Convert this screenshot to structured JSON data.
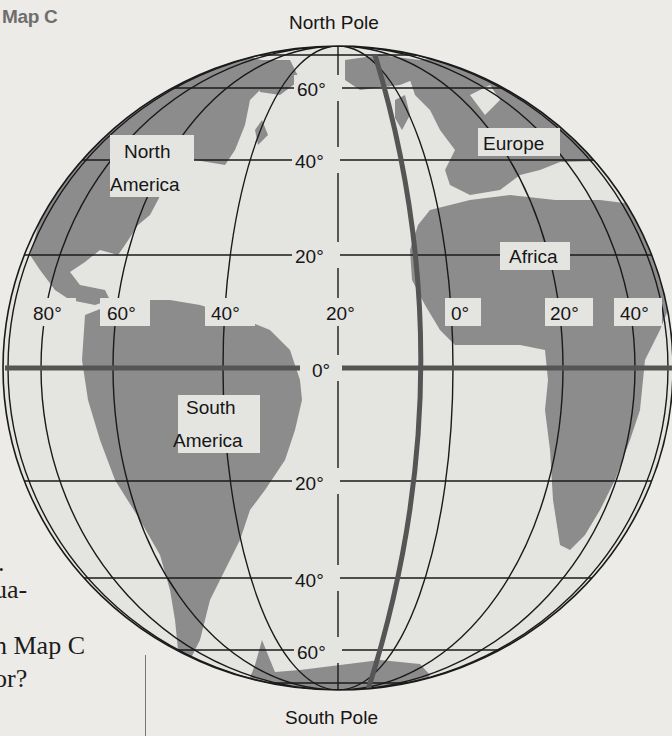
{
  "map": {
    "title": "Map C",
    "north_pole_label": "North Pole",
    "south_pole_label": "South Pole",
    "continents": [
      {
        "name": "North America",
        "lines": [
          "North",
          "America"
        ]
      },
      {
        "name": "South America",
        "lines": [
          "South",
          "America"
        ]
      },
      {
        "name": "Europe",
        "lines": [
          "Europe"
        ]
      },
      {
        "name": "Africa",
        "lines": [
          "Africa"
        ]
      }
    ],
    "latitude_labels": [
      "60°",
      "40°",
      "20°",
      "0°",
      "20°",
      "40°",
      "60°"
    ],
    "longitude_labels": [
      "80°",
      "60°",
      "40°",
      "20°",
      "0°",
      "20°",
      "40°"
    ],
    "highlighted_lines": [
      "Equator (0° latitude)",
      "Prime Meridian (0° longitude)"
    ],
    "colors": {
      "background": "#ecebe8",
      "ocean": "#e4e4e1",
      "land": "#8c8c8c",
      "grid": "#1a1a1a",
      "highlight_line": "#555555"
    }
  },
  "page_text": {
    "fragment_1": ".",
    "fragment_2": "ua-",
    "fragment_3": "n Map C",
    "fragment_4": "or?"
  }
}
